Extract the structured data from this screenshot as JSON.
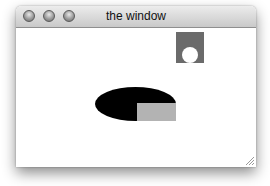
{
  "window": {
    "title": "the window",
    "buttons": [
      "close",
      "minimize",
      "zoom"
    ]
  },
  "canvas": {
    "shapes": [
      {
        "type": "square",
        "color": "#6b6b6b",
        "x": 160,
        "y": 4,
        "w": 28,
        "h": 31
      },
      {
        "type": "circle",
        "color": "#ffffff",
        "cx": 174,
        "cy": 27,
        "r": 8
      },
      {
        "type": "ellipse",
        "color": "#000000",
        "x": 79,
        "y": 59,
        "w": 81,
        "h": 34
      },
      {
        "type": "rect",
        "color": "#b3b3b3",
        "x": 121,
        "y": 75,
        "w": 39,
        "h": 18
      }
    ]
  },
  "colors": {
    "square": "#6b6b6b",
    "circle": "#ffffff",
    "ellipse": "#000000",
    "rect": "#b3b3b3"
  }
}
